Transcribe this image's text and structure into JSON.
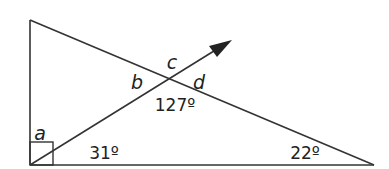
{
  "diagram": {
    "type": "geometry-triangle",
    "stroke_color": "#333333",
    "labels": {
      "a": "a",
      "b": "b",
      "c": "c",
      "d": "d"
    },
    "angles": {
      "bottom_left_partial": "31º",
      "bottom_right": "22º",
      "intersection_below": "127º"
    },
    "right_angle_marker": "bottom-left",
    "arrow": "ray-from-bottom-left-through-intersection"
  }
}
